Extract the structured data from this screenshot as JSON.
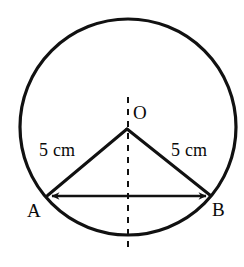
{
  "figure": {
    "kind": "circle-geometry-diagram",
    "background_color": "#ffffff",
    "stroke_color": "#111111",
    "labels": {
      "center": "O",
      "vertex_left": "A",
      "vertex_right": "B",
      "radius_left": "5 cm",
      "radius_right": "5 cm"
    },
    "circle": {
      "center_x": 128,
      "center_y": 127,
      "radius": 108,
      "stroke_width": 3.2
    },
    "points": {
      "center": {
        "x": 127,
        "y": 129
      },
      "a": {
        "x": 47,
        "y": 196
      },
      "b": {
        "x": 211,
        "y": 196
      }
    },
    "chord": {
      "x1": 47,
      "y1": 196,
      "x2": 211,
      "y2": 196,
      "stroke_width": 2.6,
      "arrowheads": "both"
    },
    "radius_left_segment": {
      "x1": 127,
      "y1": 129,
      "x2": 47,
      "y2": 196,
      "stroke_width": 3
    },
    "radius_right_segment": {
      "x1": 127,
      "y1": 129,
      "x2": 211,
      "y2": 196,
      "stroke_width": 3
    },
    "axis_dashed": {
      "x": 128,
      "y_top": 97,
      "y_bottom": 253,
      "stroke_width": 2,
      "dash_pattern": "6 6"
    }
  }
}
